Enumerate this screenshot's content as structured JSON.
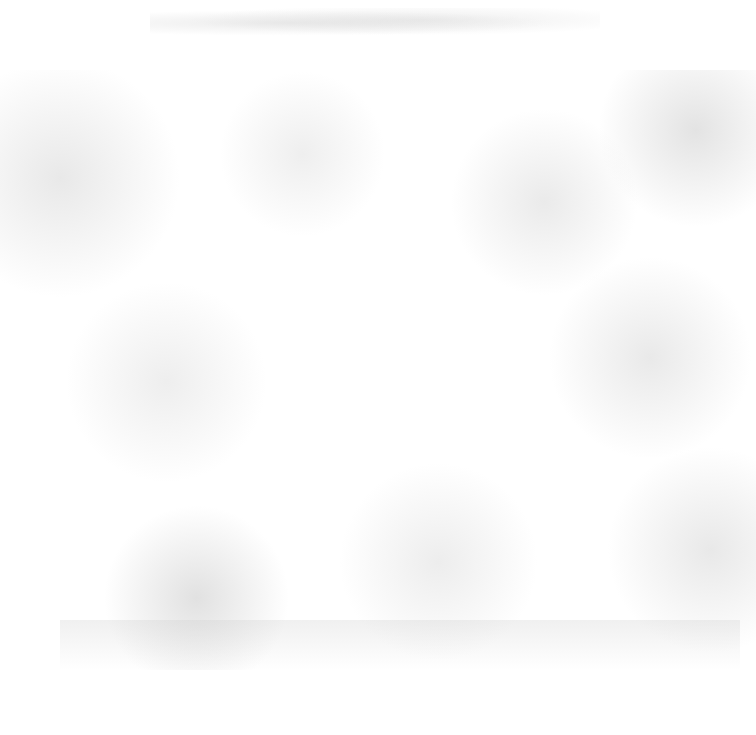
{
  "document": {
    "type": "scanned-page",
    "header_text": "",
    "body_text": "",
    "background_color": "#ffffff",
    "noise_color": "#c8c8c8"
  }
}
